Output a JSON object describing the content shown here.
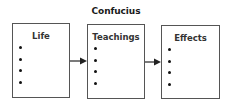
{
  "diagram": {
    "title": "Confucius",
    "boxes": [
      {
        "label": "Life",
        "bullets": 4
      },
      {
        "label": "Teachings",
        "bullets": 4
      },
      {
        "label": "Effects",
        "bullets": 4
      }
    ],
    "arrows": [
      {
        "from": "Life",
        "to": "Teachings"
      },
      {
        "from": "Teachings",
        "to": "Effects"
      }
    ],
    "colors": {
      "border": "#555555",
      "text": "#1a1a1a",
      "arrow": "#222222"
    }
  }
}
